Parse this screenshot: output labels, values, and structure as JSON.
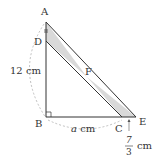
{
  "diagram": {
    "points": {
      "A": {
        "label": "A",
        "x": 46,
        "y": 22
      },
      "D": {
        "label": "D",
        "x": 46,
        "y": 41
      },
      "B": {
        "label": "B",
        "x": 46,
        "y": 117
      },
      "C": {
        "label": "C",
        "x": 122,
        "y": 117
      },
      "E": {
        "label": "E",
        "x": 136,
        "y": 117
      },
      "F": {
        "label": "F",
        "x": 87,
        "y": 77
      }
    },
    "labels": {
      "AB_length": "12 cm",
      "BC_variable": "a",
      "BC_unit": " cm",
      "CE_numerator": "7",
      "CE_denominator": "3",
      "CE_unit": "cm"
    },
    "colors": {
      "line": "#333333",
      "shade": "#d9d9d9",
      "arc": "#b0b0b0"
    }
  }
}
